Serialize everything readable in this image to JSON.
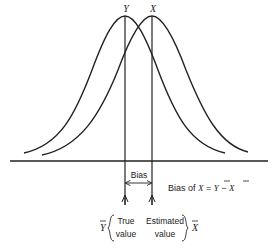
{
  "diagram": {
    "type": "two-normal-distributions-bias",
    "curves": [
      {
        "name": "Y",
        "label": "Y",
        "peak_x": 125,
        "description": "distribution of true values"
      },
      {
        "name": "X",
        "label": "X",
        "peak_x": 152,
        "description": "distribution of estimated values"
      }
    ],
    "bias_label": "Bias",
    "formula": {
      "prefix": "Bias of ",
      "var": "X",
      "equals": " = ",
      "lhs_bar": "Y",
      "minus": " − ",
      "rhs_bar": "X"
    },
    "annotations": {
      "true_symbol": "Y",
      "true_line1": "True",
      "true_line2": "value",
      "est_line1": "Estimated",
      "est_line2": "value",
      "est_symbol": "X"
    },
    "colors": {
      "ink": "#222222",
      "background": "#ffffff"
    }
  }
}
